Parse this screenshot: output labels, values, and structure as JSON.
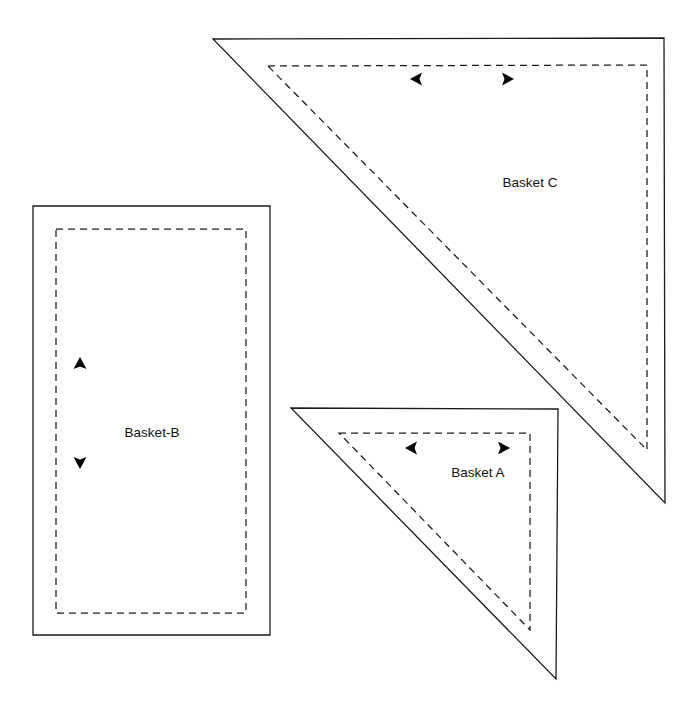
{
  "document": {
    "title": "Quilt Block Pattern Pieces",
    "background_color": "#ffffff",
    "line_color": "#1a1a1a",
    "width": 700,
    "height": 718
  },
  "pieces": [
    {
      "id": "basket-c",
      "label": "Basket C",
      "shape": "right-triangle",
      "label_x": 530,
      "label_y": 183,
      "cut_outline": "213,39 664,38 665,503",
      "seam_outline": "268,66 647,65 647,450",
      "arrows": [
        {
          "name": "grain-arrow-left",
          "direction": "left",
          "x": 416,
          "y": 79
        },
        {
          "name": "grain-arrow-right",
          "direction": "right",
          "x": 508,
          "y": 79
        }
      ]
    },
    {
      "id": "basket-b",
      "label": "Basket-B",
      "shape": "rectangle",
      "label_x": 152,
      "label_y": 433,
      "cut_outline": "33,206 270,206 270,635 33,635",
      "seam_outline": "56,229 246,229 246,613 56,613",
      "arrows": [
        {
          "name": "grain-arrow-up",
          "direction": "up",
          "x": 80,
          "y": 364
        },
        {
          "name": "grain-arrow-down",
          "direction": "down",
          "x": 80,
          "y": 461
        }
      ]
    },
    {
      "id": "basket-a",
      "label": "Basket A",
      "shape": "right-triangle",
      "label_x": 478,
      "label_y": 473,
      "cut_outline": "291,408 558,409 556,679",
      "seam_outline": "339,433 530,433 530,630",
      "arrows": [
        {
          "name": "grain-arrow-left",
          "direction": "left",
          "x": 411,
          "y": 448
        },
        {
          "name": "grain-arrow-right",
          "direction": "right",
          "x": 504,
          "y": 448
        }
      ]
    }
  ]
}
